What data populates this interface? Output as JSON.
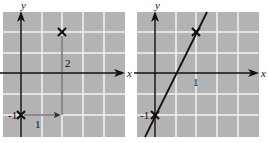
{
  "figure": {
    "colors": {
      "grid_background": "#b3b3b3",
      "grid_lines": "#f2f2f2",
      "ink": "#111111"
    }
  },
  "left_graph": {
    "x_axis_label": "x",
    "y_axis_label": "y",
    "points": [
      {
        "x": 0,
        "y": -1,
        "marker": "x"
      },
      {
        "x": 1,
        "y": 1,
        "marker": "x"
      }
    ],
    "y_intercept_label": "-1",
    "run_label": "1",
    "rise_label": "2"
  },
  "right_graph": {
    "x_axis_label": "x",
    "y_axis_label": "y",
    "points": [
      {
        "x": 0,
        "y": -1,
        "marker": "x"
      },
      {
        "x": 1,
        "y": 1,
        "marker": "x"
      }
    ],
    "x_tick_label": "1",
    "y_intercept_label": "-1",
    "line": {
      "slope": 2,
      "intercept": -1
    }
  }
}
